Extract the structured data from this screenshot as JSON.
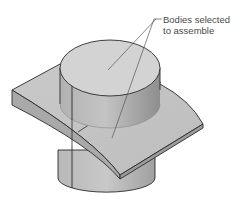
{
  "figure": {
    "callout": {
      "line1": "Bodies selected",
      "line2": "to assemble"
    },
    "parts": [
      {
        "name": "upper-cylinder",
        "description": "cylindrical body"
      },
      {
        "name": "curved-plate",
        "description": "curved plate body"
      },
      {
        "name": "lower-cylinder",
        "description": "cylindrical body below plate"
      }
    ],
    "colors": {
      "background": "#ffffff",
      "edge": "#2a2a2a",
      "face_light": "#d6d6d6",
      "face_mid": "#b9b9b9",
      "face_dark": "#9a9a9a",
      "leader": "#555555"
    }
  }
}
